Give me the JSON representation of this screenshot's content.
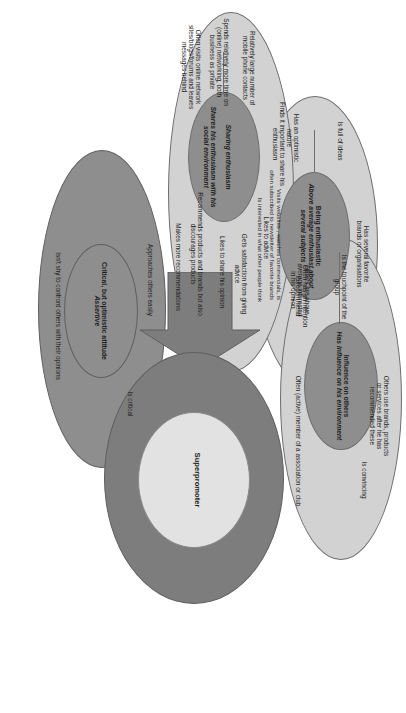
{
  "diagram": {
    "type": "venn-overlapping-ellipses",
    "orientation": "rotated-90-clockwise",
    "palette": {
      "outer_light": "#d2d2d2",
      "core_mid": "#b4b4b4",
      "accent_dark": "#8e8e8e",
      "arrow": "#7d7d7d",
      "hub_inner": "#e2e2e2",
      "outline": "#6e6e6e",
      "text": "#1d1d1d",
      "background": "#ffffff"
    },
    "hub": {
      "label": "Superpromoter"
    },
    "arrow": {
      "name": "flow-arrow",
      "direction": "right"
    },
    "clusters": [
      {
        "id": "being-enthusiastic",
        "core_title": "Being enthusiastic",
        "core_subtitle": "Above average enthusiast about several subjects",
        "traits": [
          "Is full of ideas",
          "Has an optimistic nature",
          "Has several favorite\nbrands or organisations",
          "Often has an intention\nto recommend",
          "Visits websites , watches commercials, is\noften subscribed to newsletter of favorite brands",
          "Is interested in what other people think"
        ]
      },
      {
        "id": "influence-on-others",
        "core_title": "Influence on others",
        "core_subtitle": "Has influence on his environment",
        "traits": [
          "Is the touchpoint of the group",
          "Others use brands, products\nor services after he has\nrecommended these",
          "Is convincing",
          "Often (active) member of a association or club",
          "Others are above\naverage interested\nin his opinion"
        ]
      },
      {
        "id": "sharing-enthusiasm",
        "core_title": "Sharing enthusiasm",
        "core_subtitle": "Shares his enthusiasm with his social environment",
        "traits": [
          "Likes to advice",
          "Gets satisfaction from giving\nadvice",
          "Likes to share his opinion",
          "Finds it important to share his\nenthusiasm",
          "Relatively large number of\nmobile phone contacts",
          "Spends relatively more time on\n(online) networking, both\nbusiness as private",
          "Often visits online network\nsites/blogs/forums and leaves\nmessages behind",
          "Recommends products and brands but also\ndiscourages products",
          "Makes more recommendations"
        ]
      },
      {
        "id": "critical-optimistic",
        "core_title": "Critical, but optimistic attitude",
        "core_subtitle": "Assertive",
        "traits": [
          "Approaches others easily",
          "Is critical",
          "Isn't shy to confront others with their opinions"
        ]
      }
    ]
  }
}
